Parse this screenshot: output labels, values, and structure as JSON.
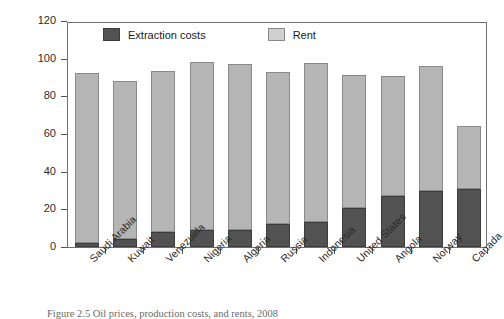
{
  "chart_data": {
    "type": "bar",
    "subtype": "stacked",
    "title": "",
    "xlabel": "",
    "ylabel": "Dollars per barrel",
    "ylim": [
      0,
      120
    ],
    "yticks": [
      0,
      20,
      40,
      60,
      80,
      100,
      120
    ],
    "grid": false,
    "legend_position": "top-inside",
    "categories": [
      "Saudi Arabia",
      "Kuwait",
      "Venezuela",
      "Nigeria",
      "Algeria",
      "Russia",
      "Indonesia",
      "United States",
      "Angola",
      "Norway",
      "Canada"
    ],
    "series": [
      {
        "name": "Extraction costs",
        "color": "#525252",
        "values": [
          2,
          4,
          8,
          9,
          9,
          12,
          13.5,
          20.5,
          27,
          30,
          31
        ]
      },
      {
        "name": "Rent",
        "color": "#b5b5b5",
        "values": [
          90.5,
          84,
          85.5,
          89,
          88,
          81,
          84,
          71,
          64,
          66,
          33
        ]
      }
    ],
    "totals": [
      92.5,
      88,
      93.5,
      98,
      97,
      93,
      97.5,
      91.5,
      91,
      96,
      64
    ]
  },
  "axes": {
    "y_title": "Dollars per barrel",
    "y_tick_labels": [
      "0",
      "20",
      "40",
      "60",
      "80",
      "100",
      "120"
    ]
  },
  "legend": {
    "entries": [
      {
        "label": "Extraction costs",
        "swatch": "dark"
      },
      {
        "label": "Rent",
        "swatch": "light"
      }
    ]
  },
  "caption": {
    "text": "Figure 2.5  Oil prices, production costs, and rents, 2008"
  }
}
